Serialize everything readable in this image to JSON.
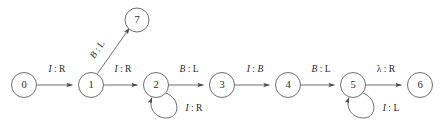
{
  "diagram": {
    "type": "finite-state-machine",
    "background_color": "#ffffff",
    "stroke_color": "#5d5d5d",
    "text_color": "#1f1f1f",
    "node_radius": 12.5,
    "small_node_radius": 12.0,
    "states": [
      {
        "id": "0",
        "label": "0",
        "cx": 24,
        "cy": 85
      },
      {
        "id": "1",
        "label": "1",
        "cx": 91,
        "cy": 85
      },
      {
        "id": "2",
        "label": "2",
        "cx": 156,
        "cy": 85
      },
      {
        "id": "3",
        "label": "3",
        "cx": 222,
        "cy": 85
      },
      {
        "id": "4",
        "label": "4",
        "cx": 288,
        "cy": 85
      },
      {
        "id": "5",
        "label": "5",
        "cx": 353,
        "cy": 85
      },
      {
        "id": "6",
        "label": "6",
        "cx": 420,
        "cy": 85
      },
      {
        "id": "7",
        "label": "7",
        "cx": 137,
        "cy": 20
      }
    ],
    "transitions": [
      {
        "from": "0",
        "to": "1",
        "kind": "straight",
        "read": "I",
        "write": "R",
        "separator": ":",
        "label": "I : R",
        "read_style": "italic",
        "write_style": "roman",
        "label_x": 57,
        "label_y": 70
      },
      {
        "from": "1",
        "to": "7",
        "kind": "diagonal",
        "read": "B",
        "write": "L",
        "separator": ":",
        "label": "B : L",
        "read_style": "italic",
        "write_style": "roman",
        "label_x": 98,
        "label_y": 50,
        "label_rotation": -57
      },
      {
        "from": "1",
        "to": "2",
        "kind": "straight",
        "read": "I",
        "write": "R",
        "separator": ":",
        "label": "I : R",
        "read_style": "italic",
        "write_style": "roman",
        "label_x": 123,
        "label_y": 70
      },
      {
        "from": "2",
        "to": "2",
        "kind": "self-loop",
        "read": "I",
        "write": "R",
        "separator": ":",
        "label": "I : R",
        "read_style": "italic",
        "write_style": "roman",
        "label_x": 194,
        "label_y": 109
      },
      {
        "from": "2",
        "to": "3",
        "kind": "straight",
        "read": "B",
        "write": "L",
        "separator": ":",
        "label": "B : L",
        "read_style": "italic",
        "write_style": "roman",
        "label_x": 189,
        "label_y": 70
      },
      {
        "from": "3",
        "to": "4",
        "kind": "straight",
        "read": "I",
        "write": "B",
        "separator": ":",
        "label": "I : B",
        "read_style": "italic",
        "write_style": "italic",
        "label_x": 255,
        "label_y": 70
      },
      {
        "from": "4",
        "to": "5",
        "kind": "straight",
        "read": "B",
        "write": "L",
        "separator": ":",
        "label": "B : L",
        "read_style": "italic",
        "write_style": "roman",
        "label_x": 321,
        "label_y": 70
      },
      {
        "from": "5",
        "to": "5",
        "kind": "self-loop",
        "read": "I",
        "write": "L",
        "separator": ":",
        "label": "I : L",
        "read_style": "italic",
        "write_style": "roman",
        "label_x": 391,
        "label_y": 109
      },
      {
        "from": "5",
        "to": "6",
        "kind": "straight",
        "read": "λ",
        "write": "R",
        "separator": ":",
        "label": "λ : R",
        "read_style": "roman",
        "write_style": "roman",
        "label_x": 386,
        "label_y": 70
      }
    ]
  }
}
